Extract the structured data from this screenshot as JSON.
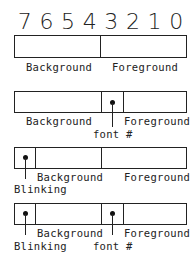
{
  "bit_numbers": [
    "7",
    "6",
    "5",
    "4",
    "3",
    "2",
    "1",
    "0"
  ],
  "diagrams": [
    {
      "id": "basic",
      "labels": {
        "background": "Background",
        "foreground": "Foreground"
      }
    },
    {
      "id": "font",
      "labels": {
        "background": "Background",
        "foreground": "Foreground",
        "font": "font #"
      }
    },
    {
      "id": "blink",
      "labels": {
        "blinking": "Blinking",
        "background": "Background",
        "foreground": "Foreground"
      }
    },
    {
      "id": "blink-font",
      "labels": {
        "blinking": "Blinking",
        "background": "Background",
        "foreground": "Foreground",
        "font": "font #"
      }
    }
  ],
  "colors": {
    "line": "#222222",
    "background": "#ffffff"
  }
}
